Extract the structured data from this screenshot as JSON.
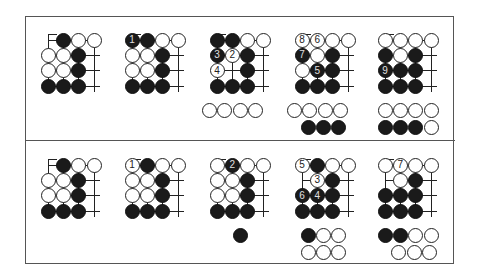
{
  "layout": {
    "cell": 15.4,
    "stone": 15,
    "diagram_x": [
      48,
      132,
      217,
      302,
      385
    ],
    "panel_y": [
      40,
      165
    ]
  },
  "panels": [
    {
      "name": "top-panel",
      "diagrams": [
        {
          "grid": [
            [
              null,
              {
                "c": "b"
              },
              {
                "c": "w"
              },
              {
                "c": "w"
              }
            ],
            [
              {
                "c": "w"
              },
              {
                "c": "w"
              },
              {
                "c": "b"
              },
              null
            ],
            [
              {
                "c": "w"
              },
              {
                "c": "w"
              },
              {
                "c": "b"
              },
              null
            ],
            [
              {
                "c": "b"
              },
              {
                "c": "b"
              },
              {
                "c": "b"
              },
              null
            ]
          ],
          "extras": []
        },
        {
          "grid": [
            [
              {
                "c": "b",
                "n": "1"
              },
              {
                "c": "b"
              },
              {
                "c": "w"
              },
              {
                "c": "w"
              }
            ],
            [
              {
                "c": "w"
              },
              {
                "c": "w"
              },
              {
                "c": "b"
              },
              null
            ],
            [
              {
                "c": "w"
              },
              {
                "c": "w"
              },
              {
                "c": "b"
              },
              null
            ],
            [
              {
                "c": "b"
              },
              {
                "c": "b"
              },
              {
                "c": "b"
              },
              null
            ]
          ],
          "extras": []
        },
        {
          "grid": [
            [
              {
                "c": "b"
              },
              {
                "c": "b"
              },
              {
                "c": "w"
              },
              {
                "c": "w"
              }
            ],
            [
              {
                "c": "b",
                "n": "3"
              },
              {
                "c": "w",
                "n": "2"
              },
              {
                "c": "b"
              },
              null
            ],
            [
              {
                "c": "w",
                "n": "4"
              },
              null,
              {
                "c": "b"
              },
              null
            ],
            [
              {
                "c": "b"
              },
              {
                "c": "b"
              },
              {
                "c": "b"
              },
              null
            ]
          ],
          "extras": [
            {
              "dx": -0.5,
              "dy": 4.6,
              "stones": [
                "w",
                "w",
                "w",
                "w"
              ]
            }
          ]
        },
        {
          "grid": [
            [
              {
                "c": "w",
                "n": "8"
              },
              {
                "c": "w",
                "n": "6"
              },
              {
                "c": "w"
              },
              {
                "c": "w"
              }
            ],
            [
              {
                "c": "b",
                "n": "7"
              },
              {
                "c": "w"
              },
              {
                "c": "b"
              },
              null
            ],
            [
              {
                "c": "w"
              },
              {
                "c": "b",
                "n": "5"
              },
              {
                "c": "b"
              },
              null
            ],
            [
              {
                "c": "b"
              },
              {
                "c": "b"
              },
              {
                "c": "b"
              },
              null
            ]
          ],
          "extras": [
            {
              "dx": -0.5,
              "dy": 4.6,
              "stones": [
                "w",
                "w",
                "w",
                "w"
              ]
            },
            {
              "dx": 0.4,
              "dy": 5.7,
              "stones": [
                "b",
                "b",
                "b"
              ]
            }
          ]
        },
        {
          "grid": [
            [
              {
                "c": "w"
              },
              {
                "c": "w"
              },
              {
                "c": "w"
              },
              {
                "c": "w"
              }
            ],
            [
              {
                "c": "b"
              },
              {
                "c": "w"
              },
              {
                "c": "b"
              },
              null
            ],
            [
              {
                "c": "b",
                "n": "9"
              },
              {
                "c": "b"
              },
              {
                "c": "b"
              },
              null
            ],
            [
              {
                "c": "b"
              },
              {
                "c": "b"
              },
              {
                "c": "b"
              },
              null
            ]
          ],
          "extras": [
            {
              "dx": 0,
              "dy": 4.6,
              "stones": [
                "w",
                "w",
                "w",
                "w"
              ]
            },
            {
              "dx": 0,
              "dy": 5.7,
              "stones": [
                "b",
                "b",
                "b",
                "w"
              ]
            }
          ]
        }
      ]
    },
    {
      "name": "bottom-panel",
      "diagrams": [
        {
          "grid": [
            [
              null,
              {
                "c": "b"
              },
              {
                "c": "w"
              },
              {
                "c": "w"
              }
            ],
            [
              {
                "c": "w"
              },
              {
                "c": "w"
              },
              {
                "c": "b"
              },
              null
            ],
            [
              {
                "c": "w"
              },
              {
                "c": "w"
              },
              {
                "c": "b"
              },
              null
            ],
            [
              {
                "c": "b"
              },
              {
                "c": "b"
              },
              {
                "c": "b"
              },
              null
            ]
          ],
          "extras": []
        },
        {
          "grid": [
            [
              {
                "c": "w",
                "n": "1"
              },
              {
                "c": "b"
              },
              {
                "c": "w"
              },
              {
                "c": "w"
              }
            ],
            [
              {
                "c": "w"
              },
              {
                "c": "w"
              },
              {
                "c": "b"
              },
              null
            ],
            [
              {
                "c": "w"
              },
              {
                "c": "w"
              },
              {
                "c": "b"
              },
              null
            ],
            [
              {
                "c": "b"
              },
              {
                "c": "b"
              },
              {
                "c": "b"
              },
              null
            ]
          ],
          "extras": []
        },
        {
          "grid": [
            [
              {
                "c": "w"
              },
              {
                "c": "b",
                "n": "2"
              },
              {
                "c": "w"
              },
              {
                "c": "w"
              }
            ],
            [
              {
                "c": "w"
              },
              {
                "c": "w"
              },
              {
                "c": "b"
              },
              null
            ],
            [
              {
                "c": "w"
              },
              {
                "c": "w"
              },
              {
                "c": "b"
              },
              null
            ],
            [
              {
                "c": "b"
              },
              {
                "c": "b"
              },
              {
                "c": "b"
              },
              null
            ]
          ],
          "extras": [
            {
              "dx": 1.55,
              "dy": 4.6,
              "stones": [
                "b"
              ]
            }
          ]
        },
        {
          "grid": [
            [
              {
                "c": "w",
                "n": "5"
              },
              {
                "c": "b"
              },
              {
                "c": "w"
              },
              {
                "c": "w"
              }
            ],
            [
              null,
              {
                "c": "w",
                "n": "3"
              },
              {
                "c": "b"
              },
              null
            ],
            [
              {
                "c": "b",
                "n": "6"
              },
              {
                "c": "b",
                "n": "4"
              },
              {
                "c": "b"
              },
              null
            ],
            [
              {
                "c": "b"
              },
              {
                "c": "b"
              },
              {
                "c": "b"
              },
              null
            ]
          ],
          "extras": [
            {
              "dx": 0.4,
              "dy": 4.6,
              "stones": [
                "b",
                "w",
                "w"
              ]
            },
            {
              "dx": 0.4,
              "dy": 5.7,
              "stones": [
                "w",
                "w",
                "w"
              ]
            }
          ]
        },
        {
          "grid": [
            [
              {
                "c": "w"
              },
              {
                "c": "w",
                "n": "7"
              },
              {
                "c": "w"
              },
              {
                "c": "w"
              }
            ],
            [
              null,
              {
                "c": "w"
              },
              {
                "c": "b"
              },
              null
            ],
            [
              {
                "c": "b"
              },
              {
                "c": "b"
              },
              {
                "c": "b"
              },
              null
            ],
            [
              {
                "c": "b"
              },
              {
                "c": "b"
              },
              {
                "c": "b"
              },
              null
            ]
          ],
          "extras": [
            {
              "dx": 0,
              "dy": 4.6,
              "stones": [
                "b",
                "b",
                "w",
                "w"
              ]
            },
            {
              "dx": 0.9,
              "dy": 5.7,
              "stones": [
                "w",
                "w",
                "w"
              ]
            }
          ]
        }
      ]
    }
  ]
}
